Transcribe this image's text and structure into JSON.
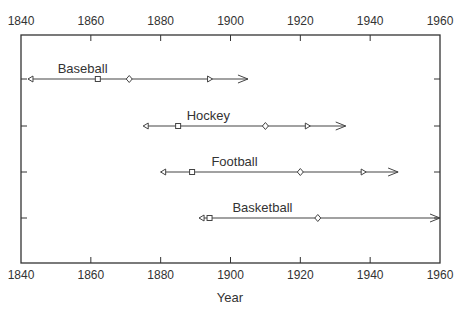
{
  "chart_data": {
    "type": "timeline",
    "title": "",
    "xlabel": "Year",
    "ylabel": "",
    "xlim": [
      1840,
      1960
    ],
    "x_ticks": [
      1840,
      1860,
      1880,
      1900,
      1920,
      1940,
      1960
    ],
    "grid": false,
    "legend": null,
    "series": [
      {
        "name": "Baseball",
        "start": 1842,
        "square": 1862,
        "diamond": 1871,
        "marker_end": 1894,
        "arrow_end": 1905
      },
      {
        "name": "Hockey",
        "start": 1875,
        "square": 1885,
        "diamond": 1910,
        "marker_end": 1922,
        "arrow_end": 1933
      },
      {
        "name": "Football",
        "start": 1880,
        "square": 1889,
        "diamond": 1920,
        "marker_end": 1938,
        "arrow_end": 1948
      },
      {
        "name": "Basketball",
        "start": 1891,
        "square": 1894,
        "diamond": 1925,
        "marker_end": null,
        "arrow_end": 1960
      }
    ]
  },
  "colors": {
    "axis": "#333333",
    "line": "#444444",
    "text": "#333333"
  }
}
